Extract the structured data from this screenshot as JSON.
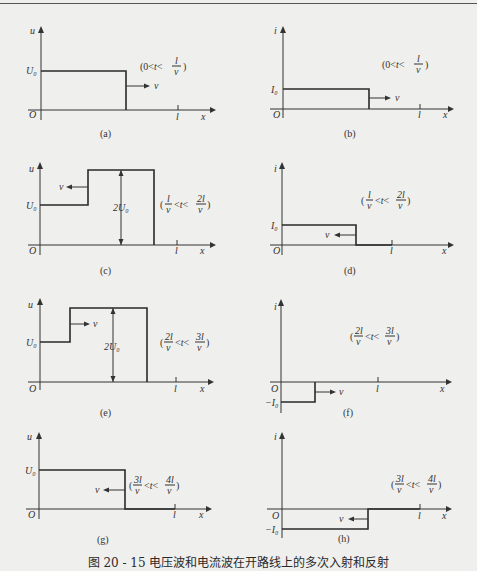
{
  "figure_caption": "图 20 - 15   电压波和电流波在开路线上的多次入射和反射",
  "labels": {
    "origin": "O",
    "x_axis": "x",
    "length_tick": "l",
    "u_axis": "u",
    "i_axis": "i",
    "U0": "U₀",
    "I0": "I₀",
    "neg_I0": "−I₀",
    "twoU0": "2U₀",
    "velocity": "v"
  },
  "panels": [
    {
      "id": "a",
      "caption": "(a)",
      "quantity": "u",
      "time_range": "(0<t<l/v)",
      "t_lo": "0",
      "t_hi_num": "l",
      "t_hi_den": "v",
      "wave_direction": "right",
      "segments": [
        {
          "x0": 0,
          "x1": 0.65,
          "level": 1
        }
      ]
    },
    {
      "id": "b",
      "caption": "(b)",
      "quantity": "i",
      "time_range": "(0<t<l/v)",
      "t_lo": "0",
      "t_hi_num": "l",
      "t_hi_den": "v",
      "wave_direction": "right",
      "segments": [
        {
          "x0": 0,
          "x1": 0.65,
          "level": 1
        }
      ]
    },
    {
      "id": "c",
      "caption": "(c)",
      "quantity": "u",
      "time_range": "(l/v<t<2l/v)",
      "t_lo_num": "l",
      "t_lo_den": "v",
      "t_hi_num": "2l",
      "t_hi_den": "v",
      "wave_direction": "left",
      "segments": [
        {
          "x0": 0,
          "x1": 0.35,
          "level": 1
        },
        {
          "x0": 0.35,
          "x1": 0.85,
          "level": 2
        }
      ]
    },
    {
      "id": "d",
      "caption": "(d)",
      "quantity": "i",
      "time_range": "(l/v<t<2l/v)",
      "t_lo_num": "l",
      "t_lo_den": "v",
      "t_hi_num": "2l",
      "t_hi_den": "v",
      "wave_direction": "left",
      "segments": [
        {
          "x0": 0,
          "x1": 0.67,
          "level": 1
        },
        {
          "x0": 0.67,
          "x1": 1.0,
          "level": 0
        }
      ]
    },
    {
      "id": "e",
      "caption": "(e)",
      "quantity": "u",
      "time_range": "(2l/v<t<3l/v)",
      "t_lo_num": "2l",
      "t_lo_den": "v",
      "t_hi_num": "3l",
      "t_hi_den": "v",
      "wave_direction": "right",
      "segments": [
        {
          "x0": 0,
          "x1": 0.22,
          "level": 1
        },
        {
          "x0": 0.22,
          "x1": 0.78,
          "level": 2
        }
      ]
    },
    {
      "id": "f",
      "caption": "(f)",
      "quantity": "i",
      "time_range": "(2l/v<t<3l/v)",
      "t_lo_num": "2l",
      "t_lo_den": "v",
      "t_hi_num": "3l",
      "t_hi_den": "v",
      "wave_direction": "right",
      "segments": [
        {
          "x0": 0,
          "x1": 0.35,
          "level": -1
        }
      ]
    },
    {
      "id": "g",
      "caption": "(g)",
      "quantity": "u",
      "time_range": "(3l/v<t<4l/v)",
      "t_lo_num": "3l",
      "t_lo_den": "v",
      "t_hi_num": "4l",
      "t_hi_den": "v",
      "wave_direction": "left",
      "segments": [
        {
          "x0": 0,
          "x1": 0.63,
          "level": 1
        },
        {
          "x0": 0.63,
          "x1": 1.0,
          "level": 0
        }
      ]
    },
    {
      "id": "h",
      "caption": "(h)",
      "quantity": "i",
      "time_range": "(3l/v<t<4l/v)",
      "t_lo_num": "3l",
      "t_lo_den": "v",
      "t_hi_num": "4l",
      "t_hi_den": "v",
      "wave_direction": "left",
      "segments": [
        {
          "x0": 0,
          "x1": 0.63,
          "level": -1
        },
        {
          "x0": 0.63,
          "x1": 1.0,
          "level": 0
        }
      ]
    }
  ]
}
